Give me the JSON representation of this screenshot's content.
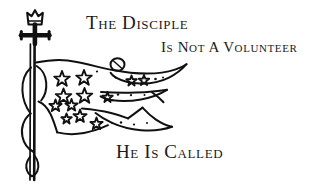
{
  "artwork": {
    "title": "The Disciple Is Not A Volunteer — He Is Called",
    "medium": "black ink line drawing",
    "background_color": "#ffffff",
    "ink_color": "#111111"
  },
  "caption": {
    "line1": "The Disciple",
    "line2": "Is Not A Volunteer",
    "line3": "He Is Called"
  },
  "illustration": {
    "name": "crowned-cross-with-tattered-star-banner",
    "elements": {
      "crown": "crown-icon",
      "cross": "cross-icon",
      "pole": "flag-pole",
      "banner": "tattered-banner",
      "streamers": "banner-streamers",
      "stars": "banner-stars",
      "ring": "banner-ring",
      "ribbon": "pole-ribbon"
    },
    "star_count": 18,
    "streamer_count": 3
  }
}
